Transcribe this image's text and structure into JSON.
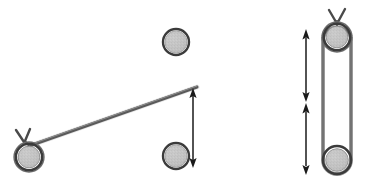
{
  "figure": {
    "title": "Pulley and inclined rod mechanism diagram",
    "background_color": "#ffffff",
    "width": 365,
    "height": 189,
    "colors": {
      "ring_stroke": "#3b3b3b",
      "ring_stroke_light": "#6e6e6e",
      "disc_fill": "#c2c2c2",
      "rod_stroke": "#5a5a5a",
      "belt_stroke": "#6a6a6a",
      "arrow_stroke": "#1a1a1a",
      "hook_stroke": "#4a4a4a"
    },
    "panels": [
      {
        "name": "left-panel",
        "label": "Inclined rod on pulley with vertical displacement arrow",
        "elements": [
          {
            "name": "left-pulley",
            "type": "pulley",
            "cx": 29,
            "cy": 157,
            "outer_r": 15,
            "inner_r": 11,
            "has_hook": true
          },
          {
            "name": "inclined-rod",
            "type": "line",
            "x1": 29,
            "y1": 146,
            "x2": 197,
            "y2": 87
          },
          {
            "name": "upper-ball",
            "type": "ball",
            "cx": 176,
            "cy": 42,
            "r": 13
          },
          {
            "name": "lower-ball",
            "type": "ball",
            "cx": 176,
            "cy": 156,
            "r": 13
          },
          {
            "name": "displacement-arrow",
            "type": "double-arrow",
            "x": 193,
            "y1": 90,
            "y2": 166
          }
        ]
      },
      {
        "name": "right-panel",
        "label": "Vertical belt-driven twin pulley with two stacked displacement arrows",
        "elements": [
          {
            "name": "top-right-pulley",
            "type": "pulley",
            "cx": 337,
            "cy": 37,
            "outer_r": 15,
            "inner_r": 11,
            "has_hook": true
          },
          {
            "name": "bottom-right-pulley",
            "type": "pulley",
            "cx": 337,
            "cy": 160,
            "outer_r": 14,
            "inner_r": 11,
            "has_hook": false
          },
          {
            "name": "belt-left-strand",
            "type": "line",
            "x1": 323,
            "y1": 37,
            "x2": 323,
            "y2": 160
          },
          {
            "name": "belt-right-strand",
            "type": "line",
            "x1": 351,
            "y1": 37,
            "x2": 351,
            "y2": 160
          },
          {
            "name": "upper-displacement-arrow",
            "type": "double-arrow",
            "x": 306,
            "y1": 30,
            "y2": 100
          },
          {
            "name": "lower-displacement-arrow",
            "type": "double-arrow",
            "x": 306,
            "y1": 103,
            "y2": 173
          }
        ]
      }
    ]
  }
}
